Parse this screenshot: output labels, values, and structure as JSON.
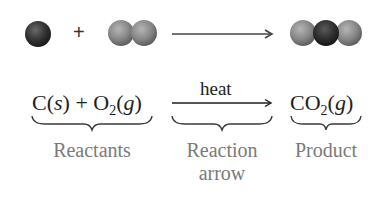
{
  "molecule_row": {
    "reactant_1": {
      "name": "carbon atom",
      "atoms": [
        "C"
      ],
      "color": "#3a3a3a"
    },
    "plus": "+",
    "reactant_2": {
      "name": "oxygen molecule",
      "atoms": [
        "O",
        "O"
      ],
      "color": "#8a8a8a"
    },
    "product": {
      "name": "carbon dioxide molecule",
      "atoms": [
        "O",
        "C",
        "O"
      ]
    }
  },
  "equation": {
    "reactants": {
      "c": "C",
      "c_state": "s",
      "plus": "+",
      "o": "O",
      "o_sub": "2",
      "o_state": "g"
    },
    "condition": "heat",
    "product": {
      "formula": "CO",
      "sub": "2",
      "state": "g"
    }
  },
  "labels": {
    "reactants": "Reactants",
    "reaction_arrow_line1": "Reaction",
    "reaction_arrow_line2": "arrow",
    "product": "Product"
  },
  "colors": {
    "carbon": "#333333",
    "oxygen": "#8c8c8c",
    "text": "#1e1e1e",
    "label": "#7a7a7a"
  }
}
